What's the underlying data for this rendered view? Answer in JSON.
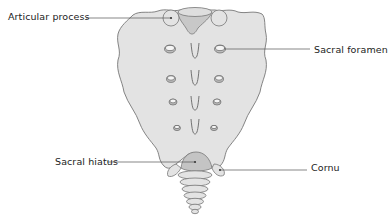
{
  "diagram": {
    "labels": {
      "articular_process": "Articular process",
      "sacral_foramen": "Sacral foramen",
      "sacral_hiatus": "Sacral hiatus",
      "cornu": "Cornu"
    },
    "colors": {
      "bone_fill": "#e3e3e3",
      "bone_outline": "#777777",
      "shadow_fill": "#c4c4c4",
      "leader_line": "#555555",
      "text": "#222222",
      "background": "#ffffff"
    }
  }
}
